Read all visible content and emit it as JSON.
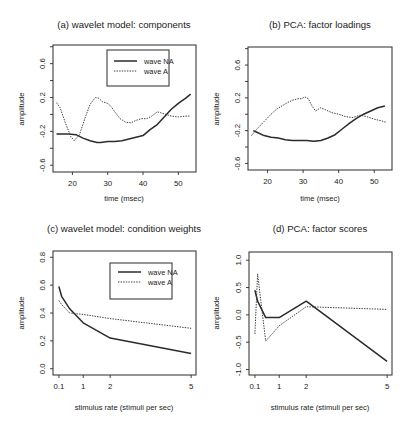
{
  "figure": {
    "background": "#ffffff",
    "line_color": "#2b2b2b"
  },
  "chart_data": [
    {
      "id": "a",
      "type": "line",
      "title": "(a) wavelet model: components",
      "xlabel": "time (msec)",
      "ylabel": "amplitude",
      "xlim": [
        14.5,
        55
      ],
      "ylim": [
        -0.68,
        0.82
      ],
      "xticks": [
        20,
        30,
        40,
        50
      ],
      "xtick_labels": [
        "20",
        "30",
        "40",
        "50"
      ],
      "yticks": [
        -0.6,
        -0.4,
        -0.2,
        0.0,
        0.2,
        0.4,
        0.6,
        0.8
      ],
      "ytick_labels": [
        "-0.6",
        "",
        "-0.2",
        "",
        "0.2",
        "",
        "0.6",
        ""
      ],
      "grid": false,
      "legend": {
        "position": "upper right",
        "entries": [
          {
            "label": "wave NA",
            "style": "solid"
          },
          {
            "label": "wave A",
            "style": "dotted"
          }
        ]
      },
      "series": [
        {
          "name": "wave NA",
          "style": "solid",
          "x": [
            15.5,
            17,
            19,
            21,
            23,
            25,
            27,
            28,
            30,
            32,
            34,
            36,
            38,
            40,
            42,
            44,
            46,
            48,
            50,
            52,
            53.5
          ],
          "y": [
            -0.23,
            -0.23,
            -0.23,
            -0.24,
            -0.28,
            -0.31,
            -0.33,
            -0.33,
            -0.32,
            -0.32,
            -0.31,
            -0.29,
            -0.27,
            -0.25,
            -0.18,
            -0.12,
            -0.03,
            0.06,
            0.13,
            0.19,
            0.24
          ]
        },
        {
          "name": "wave A",
          "style": "dotted",
          "x": [
            15.5,
            16.5,
            18,
            19.5,
            20.5,
            22,
            23.5,
            25,
            26.5,
            27.5,
            28.5,
            30,
            31,
            32,
            33.5,
            35,
            36.5,
            38,
            39.5,
            41,
            42.5,
            44,
            45,
            46.5,
            48,
            50,
            52,
            53.5
          ],
          "y": [
            0.14,
            0.08,
            -0.1,
            -0.26,
            -0.31,
            -0.24,
            -0.05,
            0.12,
            0.2,
            0.19,
            0.15,
            0.13,
            0.09,
            0.03,
            -0.05,
            -0.09,
            -0.1,
            -0.07,
            -0.05,
            -0.05,
            -0.02,
            0.03,
            0.02,
            0.0,
            -0.02,
            -0.03,
            -0.02,
            -0.02
          ]
        }
      ]
    },
    {
      "id": "b",
      "type": "line",
      "title": "(b) PCA: factor loadings",
      "xlabel": "time (msec)",
      "ylabel": "amplitude",
      "xlim": [
        14.5,
        55
      ],
      "ylim": [
        -0.68,
        0.82
      ],
      "xticks": [
        20,
        30,
        40,
        50
      ],
      "xtick_labels": [
        "20",
        "30",
        "40",
        "50"
      ],
      "yticks": [
        -0.6,
        -0.4,
        -0.2,
        0.0,
        0.2,
        0.4,
        0.6,
        0.8
      ],
      "ytick_labels": [
        "-0.6",
        "",
        "-0.2",
        "",
        "0.2",
        "",
        "0.6",
        ""
      ],
      "grid": false,
      "legend": null,
      "series": [
        {
          "name": "solid",
          "style": "solid",
          "x": [
            16,
            17,
            19,
            21,
            23,
            25,
            27,
            29,
            31,
            33,
            35,
            37,
            39,
            41,
            43,
            45,
            47,
            49,
            51,
            53
          ],
          "y": [
            -0.2,
            -0.22,
            -0.26,
            -0.28,
            -0.29,
            -0.31,
            -0.32,
            -0.32,
            -0.32,
            -0.33,
            -0.32,
            -0.29,
            -0.25,
            -0.18,
            -0.11,
            -0.05,
            0.0,
            0.04,
            0.08,
            0.1
          ]
        },
        {
          "name": "dotted",
          "style": "dotted",
          "x": [
            15.5,
            17,
            19,
            21,
            22.5,
            24,
            25.5,
            27,
            28.5,
            29.5,
            30.5,
            31.5,
            32.5,
            33.5,
            35,
            36.5,
            38,
            40,
            42,
            44,
            46,
            48,
            50,
            52,
            53.5
          ],
          "y": [
            -0.26,
            -0.18,
            -0.09,
            0.0,
            0.06,
            0.1,
            0.14,
            0.17,
            0.19,
            0.19,
            0.21,
            0.19,
            0.1,
            0.04,
            0.08,
            0.05,
            0.02,
            0.0,
            -0.03,
            -0.04,
            -0.01,
            -0.03,
            -0.06,
            -0.08,
            -0.1
          ]
        }
      ]
    },
    {
      "id": "c",
      "type": "line",
      "title": "(c) wavelet model: condition weights",
      "xlabel": "stimulus rate (stimuli per sec)",
      "ylabel": "amplitude",
      "xlim": [
        -0.12,
        5.18
      ],
      "ylim": [
        -0.045,
        0.845
      ],
      "xticks": [
        0.1,
        1,
        2,
        5
      ],
      "xtick_labels": [
        "0.1",
        "1",
        "2",
        "5"
      ],
      "yticks": [
        0.0,
        0.2,
        0.4,
        0.6,
        0.8
      ],
      "ytick_labels": [
        "0.0",
        "0.2",
        "0.4",
        "0.6",
        "0.8"
      ],
      "grid": false,
      "legend": {
        "position": "upper right",
        "entries": [
          {
            "label": "wave NA",
            "style": "solid"
          },
          {
            "label": "wave A",
            "style": "dotted"
          }
        ]
      },
      "series": [
        {
          "name": "wave NA",
          "style": "solid",
          "x": [
            0.1,
            0.2,
            0.5,
            1,
            2,
            5
          ],
          "y": [
            0.59,
            0.52,
            0.43,
            0.33,
            0.22,
            0.11
          ]
        },
        {
          "name": "wave A",
          "style": "dotted",
          "x": [
            0.1,
            0.2,
            0.5,
            1,
            2,
            5
          ],
          "y": [
            0.49,
            0.46,
            0.4,
            0.39,
            0.36,
            0.29
          ]
        }
      ]
    },
    {
      "id": "d",
      "type": "line",
      "title": "(d) PCA: factor scores",
      "xlabel": "stimulus rate (stimuli per sec)",
      "ylabel": "amplitude",
      "xlim": [
        -0.12,
        5.18
      ],
      "ylim": [
        -1.1,
        1.15
      ],
      "xticks": [
        0.1,
        1,
        2,
        5
      ],
      "xtick_labels": [
        "0.1",
        "1",
        "2",
        "5"
      ],
      "yticks": [
        -1.0,
        -0.5,
        0.0,
        0.5,
        1.0
      ],
      "ytick_labels": [
        "-1.0",
        "-0.5",
        "0.0",
        "0.5",
        "1.0"
      ],
      "grid": false,
      "legend": null,
      "series": [
        {
          "name": "solid",
          "style": "solid",
          "x": [
            0.1,
            0.2,
            0.5,
            1,
            2,
            5
          ],
          "y": [
            0.45,
            0.25,
            -0.05,
            -0.05,
            0.25,
            -0.85
          ]
        },
        {
          "name": "dotted",
          "style": "dotted",
          "x": [
            0.1,
            0.2,
            0.5,
            1,
            2,
            5
          ],
          "y": [
            -0.35,
            0.75,
            -0.48,
            -0.2,
            0.15,
            0.1
          ]
        }
      ]
    }
  ],
  "panels": [
    {
      "title": "(a) wavelet model: components",
      "xlabel": "time (msec)",
      "ylabel": "amplitude"
    },
    {
      "title": "(b) PCA: factor loadings",
      "xlabel": "time (msec)",
      "ylabel": "amplitude"
    },
    {
      "title": "(c) wavelet model: condition weights",
      "xlabel": "stimulus rate (stimuli per sec)",
      "ylabel": "amplitude"
    },
    {
      "title": "(d) PCA: factor scores",
      "xlabel": "stimulus rate (stimuli per sec)",
      "ylabel": "amplitude"
    }
  ]
}
